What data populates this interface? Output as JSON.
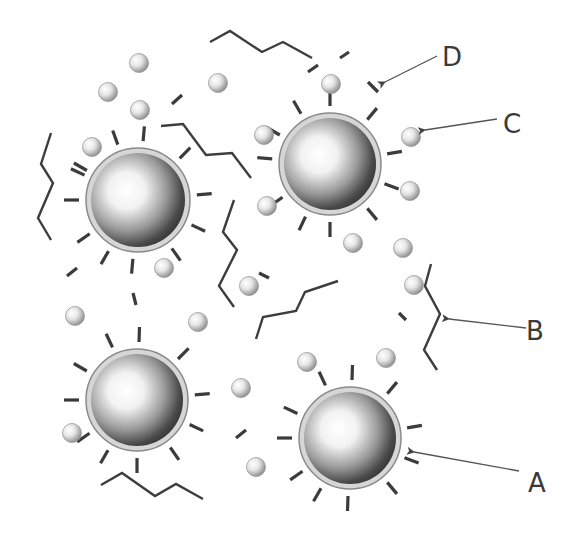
{
  "diagram": {
    "labels": [
      {
        "id": "A",
        "text": "A",
        "x": 537,
        "y": 492,
        "target": "large-particle",
        "arrow": [
          [
            519,
            471
          ],
          [
            414,
            452
          ]
        ]
      },
      {
        "id": "B",
        "text": "B",
        "x": 535,
        "y": 340,
        "target": "chain-molecule",
        "arrow": [
          [
            526,
            328
          ],
          [
            449,
            319
          ]
        ]
      },
      {
        "id": "C",
        "text": "C",
        "x": 512,
        "y": 133,
        "target": "small-sphere",
        "arrow": [
          [
            497,
            119
          ],
          [
            425,
            130
          ]
        ]
      },
      {
        "id": "D",
        "text": "D",
        "x": 452,
        "y": 66,
        "target": "free-ligand",
        "arrow": [
          [
            437,
            56
          ],
          [
            385,
            82
          ]
        ]
      }
    ],
    "large_particles": [
      {
        "cx": 138,
        "cy": 200,
        "r": 52
      },
      {
        "cx": 330,
        "cy": 164,
        "r": 51
      },
      {
        "cx": 137,
        "cy": 400,
        "r": 51
      },
      {
        "cx": 350,
        "cy": 438,
        "r": 51
      }
    ],
    "small_spheres": [
      [
        139,
        63
      ],
      [
        108,
        92
      ],
      [
        218,
        83
      ],
      [
        140,
        110
      ],
      [
        92,
        147
      ],
      [
        264,
        135
      ],
      [
        331,
        84
      ],
      [
        411,
        137
      ],
      [
        410,
        191
      ],
      [
        267,
        206
      ],
      [
        353,
        243
      ],
      [
        403,
        248
      ],
      [
        164,
        268
      ],
      [
        249,
        286
      ],
      [
        414,
        285
      ],
      [
        75,
        316
      ],
      [
        198,
        322
      ],
      [
        307,
        362
      ],
      [
        386,
        358
      ],
      [
        241,
        388
      ],
      [
        72,
        433
      ],
      [
        256,
        467
      ]
    ],
    "ligand_rays": [
      {
        "particle": 0,
        "angles": [
          -110,
          -85,
          -45,
          -5,
          25,
          55,
          95,
          120,
          145,
          180,
          205,
          210
        ]
      },
      {
        "particle": 1,
        "angles": [
          -120,
          -90,
          -50,
          -10,
          20,
          50,
          90,
          115,
          145,
          185,
          210
        ]
      },
      {
        "particle": 2,
        "angles": [
          -115,
          -88,
          -45,
          -5,
          25,
          55,
          90,
          120,
          145,
          180,
          210
        ]
      },
      {
        "particle": 3,
        "angles": [
          -115,
          -88,
          -50,
          -10,
          20,
          50,
          92,
          120,
          145,
          180,
          205
        ]
      }
    ],
    "free_ligands": [
      [
        [
          172,
          104
        ],
        [
          182,
          95
        ]
      ],
      [
        [
          67,
          276
        ],
        [
          77,
          268
        ]
      ],
      [
        [
          308,
          72
        ],
        [
          318,
          65
        ]
      ],
      [
        [
          340,
          58
        ],
        [
          349,
          52
        ]
      ],
      [
        [
          368,
          82
        ],
        [
          378,
          92
        ]
      ],
      [
        [
          133,
          293
        ],
        [
          136,
          305
        ]
      ],
      [
        [
          259,
          273
        ],
        [
          269,
          278
        ]
      ],
      [
        [
          399,
          313
        ],
        [
          406,
          320
        ]
      ],
      [
        [
          236,
          438
        ],
        [
          246,
          430
        ]
      ]
    ],
    "chains": [
      [
        [
          210,
          42
        ],
        [
          230,
          31
        ],
        [
          262,
          52
        ],
        [
          283,
          42
        ],
        [
          312,
          58
        ]
      ],
      [
        [
          51,
          133
        ],
        [
          41,
          164
        ],
        [
          53,
          183
        ],
        [
          38,
          218
        ],
        [
          51,
          240
        ]
      ],
      [
        [
          161,
          126
        ],
        [
          183,
          124
        ],
        [
          206,
          155
        ],
        [
          232,
          153
        ],
        [
          251,
          178
        ]
      ],
      [
        [
          234,
          200
        ],
        [
          223,
          232
        ],
        [
          237,
          250
        ],
        [
          219,
          286
        ],
        [
          234,
          307
        ]
      ],
      [
        [
          256,
          339
        ],
        [
          263,
          317
        ],
        [
          296,
          311
        ],
        [
          305,
          292
        ],
        [
          338,
          281
        ]
      ],
      [
        [
          431,
          264
        ],
        [
          425,
          286
        ],
        [
          440,
          314
        ],
        [
          424,
          350
        ],
        [
          437,
          370
        ]
      ],
      [
        [
          101,
          485
        ],
        [
          122,
          473
        ],
        [
          155,
          496
        ],
        [
          176,
          484
        ],
        [
          203,
          499
        ]
      ]
    ]
  }
}
